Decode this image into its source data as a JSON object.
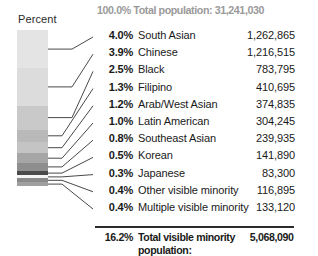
{
  "header": {
    "text": "100.0% Total population: 31,241,030",
    "color": "#9a9a9a"
  },
  "axis": {
    "percent_label": "Percent"
  },
  "total_row": {
    "percent": "16.2%",
    "label": "Total visible minority population:",
    "value": "5,068,090"
  },
  "chart_data": {
    "type": "bar",
    "title": "100.0% Total population: 31,241,030",
    "xlabel": "",
    "ylabel": "Percent",
    "grid": false,
    "legend": "none",
    "orientation": "vertical-stacked",
    "categories": [
      "South Asian",
      "Chinese",
      "Black",
      "Filipino",
      "Arab/West Asian",
      "Latin American",
      "Southeast Asian",
      "Korean",
      "Japanese",
      "Other visible minority",
      "Multiple visible minority"
    ],
    "percents": [
      "4.0%",
      "3.9%",
      "2.5%",
      "1.3%",
      "1.2%",
      "1.0%",
      "0.8%",
      "0.5%",
      "0.3%",
      "0.4%",
      "0.4%"
    ],
    "values_numeric": [
      4.0,
      3.9,
      2.5,
      1.3,
      1.2,
      1.0,
      0.8,
      0.5,
      0.3,
      0.4,
      0.4
    ],
    "counts": [
      "1,262,865",
      "1,216,515",
      "783,795",
      "410,695",
      "374,835",
      "304,245",
      "239,935",
      "141,890",
      "83,300",
      "116,895",
      "133,120"
    ],
    "counts_numeric": [
      1262865,
      1216515,
      783795,
      410695,
      374835,
      304245,
      239935,
      141890,
      83300,
      116895,
      133120
    ],
    "segment_colors": [
      "#e4e4e4",
      "#dcdcdc",
      "#c9c9c9",
      "#b9b9b9",
      "#c4c4c4",
      "#a6a6a6",
      "#8e8e8e",
      "#4a4a4a",
      "#f4f4f4",
      "#8a8a8a",
      "#a0a0a0"
    ],
    "total": {
      "percent": "16.2%",
      "label": "Total visible minority population:",
      "value": "5,068,090",
      "value_numeric": 5068090
    },
    "grand_total": {
      "percent": "100.0%",
      "label": "Total population:",
      "value": "31,241,030",
      "value_numeric": 31241030
    }
  },
  "rows": [
    {
      "pct": "4.0%",
      "cat": "South Asian",
      "val": "1,262,865"
    },
    {
      "pct": "3.9%",
      "cat": "Chinese",
      "val": "1,216,515"
    },
    {
      "pct": "2.5%",
      "cat": "Black",
      "val": "783,795"
    },
    {
      "pct": "1.3%",
      "cat": "Filipino",
      "val": "410,695"
    },
    {
      "pct": "1.2%",
      "cat": "Arab/West Asian",
      "val": "374,835"
    },
    {
      "pct": "1.0%",
      "cat": "Latin American",
      "val": "304,245"
    },
    {
      "pct": "0.8%",
      "cat": "Southeast Asian",
      "val": "239,935"
    },
    {
      "pct": "0.5%",
      "cat": "Korean",
      "val": "141,890"
    },
    {
      "pct": "0.3%",
      "cat": "Japanese",
      "val": "83,300"
    },
    {
      "pct": "0.4%",
      "cat": "Other visible minority",
      "val": "116,895"
    },
    {
      "pct": "0.4%",
      "cat": "Multiple visible minority",
      "val": "133,120"
    }
  ]
}
